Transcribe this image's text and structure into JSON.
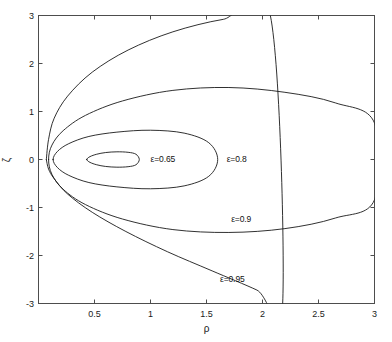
{
  "figure": {
    "background_color": "#ffffff",
    "line_color": "#1a1a1a",
    "axis_color": "#4d4d4d"
  },
  "axes": {
    "x_title": "ρ",
    "y_title": "ζ",
    "x_ticks": [
      "0.5",
      "1",
      "1.5",
      "2",
      "2.5",
      "3"
    ],
    "x_tick_values": [
      0.5,
      1,
      1.5,
      2,
      2.5,
      3
    ],
    "y_ticks": [
      "3",
      "2",
      "1",
      "0",
      "-1",
      "-2",
      "-3"
    ],
    "y_tick_values": [
      3,
      2,
      1,
      0,
      -1,
      -2,
      -3
    ],
    "xlim": [
      0,
      3
    ],
    "ylim": [
      -3,
      3
    ]
  },
  "chart_data": {
    "type": "line",
    "title": "",
    "subtitle": "",
    "xlabel": "ρ",
    "ylabel": "ζ",
    "xlim": [
      0,
      3
    ],
    "ylim": [
      -3,
      3
    ],
    "xticks": [
      0.5,
      1,
      1.5,
      2,
      2.5,
      3
    ],
    "yticks": [
      -3,
      -2,
      -1,
      0,
      1,
      2,
      3
    ],
    "grid": false,
    "legend": "inline-annotations",
    "series": [
      {
        "name": "ε=0.65",
        "label": "ε=0.65",
        "label_x": 1.0,
        "label_y": 0.0,
        "closed": true,
        "x": [
          0.43,
          0.46,
          0.52,
          0.6,
          0.7,
          0.8,
          0.87,
          0.9,
          0.87,
          0.8,
          0.7,
          0.6,
          0.52,
          0.46,
          0.43
        ],
        "y": [
          0.0,
          0.06,
          0.11,
          0.145,
          0.16,
          0.15,
          0.11,
          0.0,
          -0.11,
          -0.15,
          -0.16,
          -0.145,
          -0.11,
          -0.06,
          0.0
        ]
      },
      {
        "name": "ε=0.8",
        "label": "ε=0.8",
        "label_x": 1.68,
        "label_y": 0.0,
        "closed": true,
        "x": [
          0.13,
          0.17,
          0.27,
          0.45,
          0.7,
          1.0,
          1.3,
          1.52,
          1.6,
          1.52,
          1.3,
          1.0,
          0.7,
          0.45,
          0.27,
          0.17,
          0.13
        ],
        "y": [
          0.0,
          0.17,
          0.33,
          0.48,
          0.57,
          0.61,
          0.55,
          0.35,
          0.0,
          -0.35,
          -0.55,
          -0.61,
          -0.57,
          -0.48,
          -0.33,
          -0.17,
          0.0
        ]
      },
      {
        "name": "ε=0.9",
        "label": "ε=0.9",
        "label_x": 1.72,
        "label_y": -1.26,
        "closed": true,
        "x": [
          0.09,
          0.12,
          0.22,
          0.42,
          0.75,
          1.2,
          1.7,
          2.2,
          2.65,
          3.0,
          3.0,
          2.65,
          2.2,
          1.7,
          1.2,
          0.75,
          0.42,
          0.22,
          0.12,
          0.09
        ],
        "y": [
          0.0,
          0.3,
          0.6,
          0.92,
          1.22,
          1.44,
          1.5,
          1.4,
          1.18,
          0.76,
          -0.84,
          -1.22,
          -1.44,
          -1.52,
          -1.46,
          -1.24,
          -0.94,
          -0.62,
          -0.31,
          0.0
        ]
      },
      {
        "name": "ε=0.95",
        "label": "ε=0.95",
        "label_x": 1.62,
        "label_y": -2.52,
        "closed": false,
        "x": [
          0.07,
          0.09,
          0.14,
          0.26,
          0.48,
          0.8,
          1.2,
          1.65,
          2.07,
          2.18,
          1.95,
          1.55,
          1.15,
          0.78,
          0.48,
          0.26,
          0.14,
          0.09,
          0.07
        ],
        "y": [
          0.0,
          0.42,
          0.86,
          1.32,
          1.82,
          2.28,
          2.66,
          2.92,
          3.0,
          -3.0,
          -2.72,
          -2.32,
          -1.92,
          -1.5,
          -1.1,
          -0.72,
          -0.4,
          -0.2,
          0.0
        ]
      }
    ]
  }
}
